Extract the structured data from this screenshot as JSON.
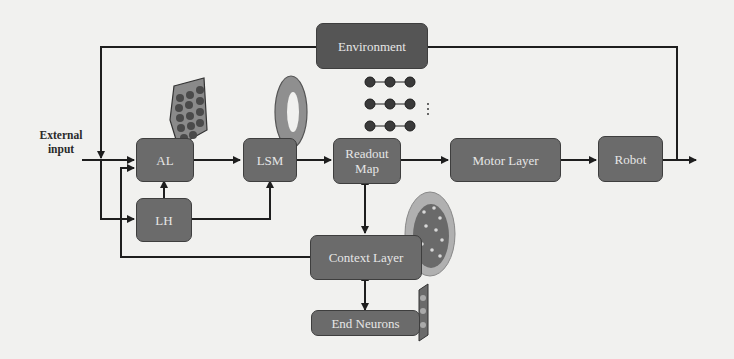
{
  "diagram": {
    "external_input_label": "External input",
    "nodes": {
      "environment": "Environment",
      "al": "AL",
      "lh": "LH",
      "lsm": "LSM",
      "readout_map": "Readout Map",
      "motor_layer": "Motor Layer",
      "robot": "Robot",
      "context_layer": "Context Layer",
      "end_neurons": "End Neurons"
    },
    "edges": [
      {
        "from": "External input",
        "to": "AL"
      },
      {
        "from": "External input",
        "to": "LH"
      },
      {
        "from": "Environment",
        "to": "AL"
      },
      {
        "from": "LH",
        "to": "AL"
      },
      {
        "from": "LH",
        "to": "LSM"
      },
      {
        "from": "AL",
        "to": "LSM"
      },
      {
        "from": "LSM",
        "to": "Readout Map"
      },
      {
        "from": "Readout Map",
        "to": "Motor Layer"
      },
      {
        "from": "Motor Layer",
        "to": "Robot"
      },
      {
        "from": "Robot",
        "to": "Environment"
      },
      {
        "from": "Readout Map",
        "to": "Context Layer",
        "bidirectional": true
      },
      {
        "from": "Context Layer",
        "to": "End Neurons",
        "bidirectional": true
      },
      {
        "from": "Context Layer",
        "to": "AL"
      }
    ],
    "colors": {
      "box_fill": "#6b6b6b",
      "box_border": "#3e3e3e",
      "box_text": "#e6e6e6",
      "wire": "#1e1e1e",
      "background": "#f1f1ef"
    }
  }
}
